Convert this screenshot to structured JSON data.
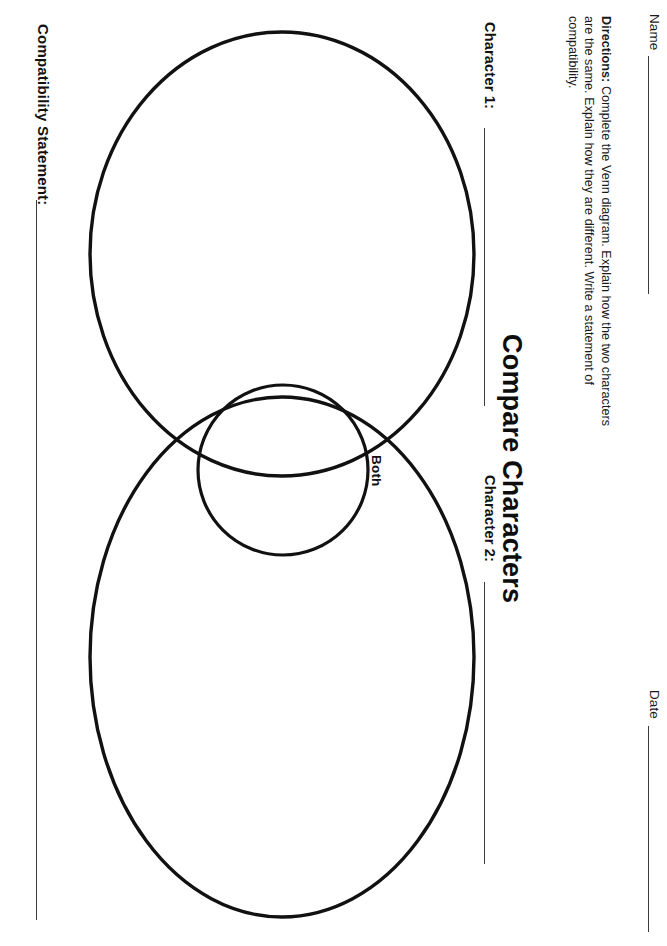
{
  "page": {
    "width": 667,
    "height": 946,
    "orientation": "rotated-90-landscape-worksheet",
    "background": "#ffffff",
    "ink_color": "#111111"
  },
  "header": {
    "name_label": "Name",
    "date_label": "Date"
  },
  "directions": {
    "lead": "Directions:",
    "body": " Complete the Venn diagram. Explain how the two characters are the same. Explain how they are different. Write a statement of compatibility.",
    "full": "Directions: Complete the Venn diagram. Explain how the two characters are the same. Explain how they are different. Write a statement of compatibility."
  },
  "title": "Compare Characters",
  "venn": {
    "character_1_label": "Character 1:",
    "character_2_label": "Character 2:",
    "both_label": "Both"
  },
  "compatibility": {
    "label": "Compatibility Statement:"
  },
  "colors": {
    "ink": "#111111",
    "rule": "#3a3a3a",
    "paper": "#ffffff"
  }
}
